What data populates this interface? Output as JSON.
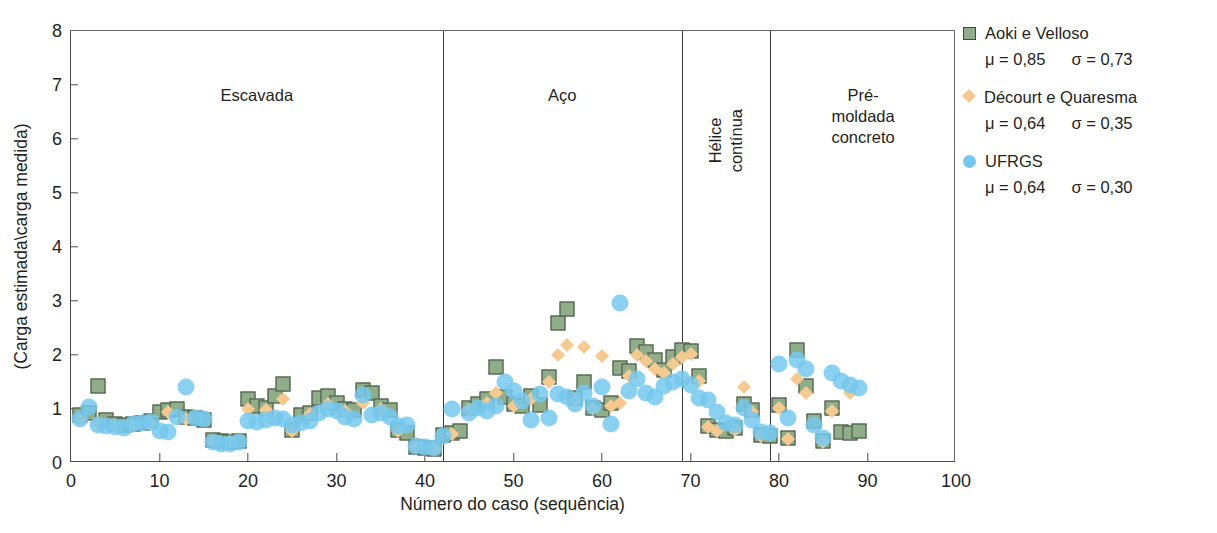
{
  "chart_data": {
    "type": "scatter",
    "title": "",
    "xlabel": "Número do caso (sequência)",
    "ylabel": "(Carga estimada\\carga medida)",
    "xlim": [
      0,
      100
    ],
    "ylim": [
      0,
      8
    ],
    "xticks": [
      0,
      10,
      20,
      30,
      40,
      50,
      60,
      70,
      80,
      90,
      100
    ],
    "yticks": [
      0,
      1,
      2,
      3,
      4,
      5,
      6,
      7,
      8
    ],
    "grid": false,
    "legend_position": "right",
    "region_dividers": [
      42,
      69,
      79
    ],
    "regions": [
      {
        "label": "Escavada",
        "x_center": 21,
        "y_label": 7.0,
        "orientation": "horizontal"
      },
      {
        "label": "Aço",
        "x_center": 55.5,
        "y_label": 7.0,
        "orientation": "horizontal"
      },
      {
        "label": "Hélice\ncontínua",
        "x_center": 74,
        "y_label": 6.55,
        "orientation": "vertical"
      },
      {
        "label": "Pré-moldada\nconcreto",
        "x_center": 89.5,
        "y_label": 7.0,
        "orientation": "horizontal"
      }
    ],
    "series": [
      {
        "name": "Aoki e Velloso",
        "marker": "square",
        "color": "#8fad88",
        "edge_color": "#3f4a3c",
        "mu": "0,85",
        "sigma": "0,73",
        "points": [
          [
            1,
            0.88
          ],
          [
            2,
            0.92
          ],
          [
            3,
            1.42
          ],
          [
            4,
            0.8
          ],
          [
            5,
            0.72
          ],
          [
            6,
            0.7
          ],
          [
            7,
            0.73
          ],
          [
            8,
            0.75
          ],
          [
            9,
            0.78
          ],
          [
            10,
            0.95
          ],
          [
            11,
            0.98
          ],
          [
            12,
            1.0
          ],
          [
            13,
            0.86
          ],
          [
            14,
            0.83
          ],
          [
            15,
            0.8
          ],
          [
            16,
            0.42
          ],
          [
            17,
            0.4
          ],
          [
            18,
            0.38
          ],
          [
            19,
            0.4
          ],
          [
            20,
            1.18
          ],
          [
            21,
            1.05
          ],
          [
            22,
            1.02
          ],
          [
            23,
            1.24
          ],
          [
            24,
            1.46
          ],
          [
            25,
            0.62
          ],
          [
            26,
            0.88
          ],
          [
            27,
            0.92
          ],
          [
            28,
            1.2
          ],
          [
            29,
            1.24
          ],
          [
            30,
            1.12
          ],
          [
            31,
            1.0
          ],
          [
            32,
            0.98
          ],
          [
            33,
            1.36
          ],
          [
            34,
            1.3
          ],
          [
            35,
            1.05
          ],
          [
            36,
            0.98
          ],
          [
            37,
            0.62
          ],
          [
            38,
            0.55
          ],
          [
            39,
            0.3
          ],
          [
            40,
            0.28
          ],
          [
            41,
            0.26
          ],
          [
            42,
            0.52
          ],
          [
            43,
            0.56
          ],
          [
            44,
            0.6
          ],
          [
            45,
            1.02
          ],
          [
            46,
            1.1
          ],
          [
            47,
            1.18
          ],
          [
            48,
            1.78
          ],
          [
            49,
            1.22
          ],
          [
            50,
            1.1
          ],
          [
            51,
            1.05
          ],
          [
            52,
            1.24
          ],
          [
            53,
            1.08
          ],
          [
            54,
            1.6
          ],
          [
            55,
            2.6
          ],
          [
            56,
            2.85
          ],
          [
            57,
            1.2
          ],
          [
            58,
            1.5
          ],
          [
            59,
            1.02
          ],
          [
            60,
            0.98
          ],
          [
            61,
            1.12
          ],
          [
            62,
            1.76
          ],
          [
            63,
            1.7
          ],
          [
            64,
            2.16
          ],
          [
            65,
            2.06
          ],
          [
            66,
            1.9
          ],
          [
            67,
            1.72
          ],
          [
            68,
            1.96
          ],
          [
            69,
            2.1
          ],
          [
            70,
            2.08
          ],
          [
            71,
            1.62
          ],
          [
            72,
            0.68
          ],
          [
            73,
            0.62
          ],
          [
            74,
            0.6
          ],
          [
            75,
            0.64
          ],
          [
            76,
            1.1
          ],
          [
            77,
            0.98
          ],
          [
            78,
            0.52
          ],
          [
            79,
            0.5
          ],
          [
            80,
            1.08
          ],
          [
            81,
            0.46
          ],
          [
            82,
            2.1
          ],
          [
            83,
            1.42
          ],
          [
            84,
            0.78
          ],
          [
            85,
            0.4
          ],
          [
            86,
            1.02
          ],
          [
            87,
            0.58
          ],
          [
            88,
            0.56
          ],
          [
            89,
            0.6
          ]
        ]
      },
      {
        "name": "Décourt e Quaresma",
        "marker": "diamond",
        "color": "#f5c98f",
        "edge_color": "#eab878",
        "mu": "0,64",
        "sigma": "0,35",
        "points": [
          [
            1,
            0.8
          ],
          [
            3,
            0.75
          ],
          [
            5,
            0.68
          ],
          [
            7,
            0.7
          ],
          [
            9,
            0.72
          ],
          [
            11,
            0.94
          ],
          [
            13,
            0.82
          ],
          [
            16,
            0.4
          ],
          [
            18,
            0.38
          ],
          [
            20,
            1.0
          ],
          [
            22,
            0.98
          ],
          [
            24,
            1.18
          ],
          [
            25,
            0.6
          ],
          [
            27,
            0.9
          ],
          [
            29,
            1.1
          ],
          [
            31,
            0.96
          ],
          [
            33,
            1.12
          ],
          [
            35,
            1.0
          ],
          [
            37,
            0.6
          ],
          [
            39,
            0.3
          ],
          [
            41,
            0.26
          ],
          [
            43,
            0.54
          ],
          [
            45,
            0.98
          ],
          [
            47,
            1.12
          ],
          [
            48,
            1.3
          ],
          [
            50,
            1.05
          ],
          [
            52,
            1.18
          ],
          [
            54,
            1.5
          ],
          [
            55,
            2.0
          ],
          [
            56,
            2.18
          ],
          [
            57,
            1.16
          ],
          [
            58,
            2.14
          ],
          [
            59,
            1.0
          ],
          [
            60,
            1.98
          ],
          [
            61,
            1.06
          ],
          [
            62,
            1.12
          ],
          [
            63,
            1.62
          ],
          [
            64,
            2.0
          ],
          [
            65,
            1.88
          ],
          [
            66,
            1.74
          ],
          [
            67,
            1.66
          ],
          [
            68,
            1.84
          ],
          [
            69,
            1.96
          ],
          [
            70,
            2.02
          ],
          [
            71,
            1.52
          ],
          [
            72,
            0.66
          ],
          [
            73,
            0.6
          ],
          [
            75,
            0.62
          ],
          [
            76,
            1.4
          ],
          [
            77,
            0.94
          ],
          [
            78,
            0.5
          ],
          [
            80,
            1.02
          ],
          [
            81,
            0.44
          ],
          [
            82,
            1.56
          ],
          [
            83,
            1.3
          ],
          [
            85,
            0.38
          ],
          [
            86,
            0.96
          ],
          [
            88,
            1.3
          ]
        ]
      },
      {
        "name": "UFRGS",
        "marker": "circle",
        "color": "#75c8ef",
        "edge_color": "#75c8ef",
        "mu": "0,64",
        "sigma": "0,30",
        "points": [
          [
            1,
            0.82
          ],
          [
            2,
            1.04
          ],
          [
            3,
            0.7
          ],
          [
            4,
            0.68
          ],
          [
            5,
            0.66
          ],
          [
            6,
            0.64
          ],
          [
            7,
            0.72
          ],
          [
            8,
            0.74
          ],
          [
            9,
            0.76
          ],
          [
            10,
            0.6
          ],
          [
            11,
            0.58
          ],
          [
            12,
            0.86
          ],
          [
            13,
            1.4
          ],
          [
            14,
            0.84
          ],
          [
            15,
            0.82
          ],
          [
            16,
            0.38
          ],
          [
            17,
            0.36
          ],
          [
            18,
            0.36
          ],
          [
            19,
            0.38
          ],
          [
            20,
            0.78
          ],
          [
            21,
            0.76
          ],
          [
            22,
            0.8
          ],
          [
            23,
            0.84
          ],
          [
            24,
            0.82
          ],
          [
            25,
            0.7
          ],
          [
            26,
            0.74
          ],
          [
            27,
            0.78
          ],
          [
            28,
            0.92
          ],
          [
            29,
            1.0
          ],
          [
            30,
            0.96
          ],
          [
            31,
            0.86
          ],
          [
            32,
            0.82
          ],
          [
            33,
            1.26
          ],
          [
            34,
            0.88
          ],
          [
            35,
            0.92
          ],
          [
            36,
            0.86
          ],
          [
            37,
            0.68
          ],
          [
            38,
            0.7
          ],
          [
            39,
            0.32
          ],
          [
            40,
            0.3
          ],
          [
            41,
            0.28
          ],
          [
            42,
            0.5
          ],
          [
            43,
            1.0
          ],
          [
            45,
            0.92
          ],
          [
            46,
            1.02
          ],
          [
            47,
            0.96
          ],
          [
            48,
            1.06
          ],
          [
            49,
            1.5
          ],
          [
            50,
            1.34
          ],
          [
            51,
            1.14
          ],
          [
            52,
            0.8
          ],
          [
            53,
            1.28
          ],
          [
            54,
            0.84
          ],
          [
            55,
            1.28
          ],
          [
            56,
            1.22
          ],
          [
            57,
            1.1
          ],
          [
            58,
            1.3
          ],
          [
            59,
            1.06
          ],
          [
            60,
            1.4
          ],
          [
            61,
            0.72
          ],
          [
            62,
            2.96
          ],
          [
            63,
            1.34
          ],
          [
            64,
            1.56
          ],
          [
            65,
            1.3
          ],
          [
            66,
            1.22
          ],
          [
            67,
            1.42
          ],
          [
            68,
            1.5
          ],
          [
            69,
            1.56
          ],
          [
            70,
            1.44
          ],
          [
            71,
            1.2
          ],
          [
            72,
            1.16
          ],
          [
            73,
            0.94
          ],
          [
            74,
            0.74
          ],
          [
            75,
            0.7
          ],
          [
            76,
            1.02
          ],
          [
            77,
            0.8
          ],
          [
            78,
            0.58
          ],
          [
            79,
            0.56
          ],
          [
            80,
            1.84
          ],
          [
            81,
            0.84
          ],
          [
            82,
            1.9
          ],
          [
            83,
            1.74
          ],
          [
            84,
            0.7
          ],
          [
            85,
            0.46
          ],
          [
            86,
            1.66
          ],
          [
            87,
            1.52
          ],
          [
            88,
            1.44
          ],
          [
            89,
            1.38
          ]
        ]
      }
    ]
  },
  "legend": {
    "mu_symbol": "μ",
    "sigma_symbol": "σ",
    "eq": "="
  }
}
